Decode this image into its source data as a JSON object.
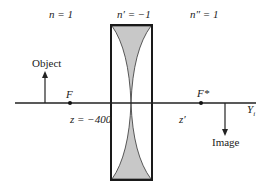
{
  "diagram": {
    "type": "optics-lens-imaging",
    "colors": {
      "line": "#222222",
      "lens_fill": "#c8c8c8",
      "background": "#ffffff"
    },
    "regions": {
      "left_index": "n = 1",
      "lens_index": "n′ = −1",
      "right_index": "n″ = 1"
    },
    "labels": {
      "object": "Object",
      "image": "Image",
      "front_focus": "F",
      "rear_focus": "F*",
      "object_distance": "z = −400",
      "image_distance": "z′",
      "axis": "Y",
      "axis_subscript": "i"
    }
  }
}
